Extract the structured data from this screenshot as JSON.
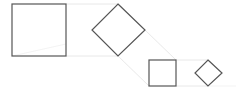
{
  "diagram": {
    "colors": {
      "shape_stroke": "#555555",
      "guide_stroke": "#e2e2e2",
      "background": "#ffffff"
    },
    "shapes": [
      {
        "id": "large-square",
        "type": "square",
        "x": 12,
        "y": 4,
        "size": 54
      },
      {
        "id": "large-diamond",
        "type": "diamond",
        "points": [
          [
            118,
            4
          ],
          [
            145,
            30
          ],
          [
            118,
            56
          ],
          [
            92,
            30
          ]
        ]
      },
      {
        "id": "small-square",
        "type": "square",
        "x": 149,
        "y": 60,
        "size": 27
      },
      {
        "id": "small-diamond",
        "type": "diamond",
        "points": [
          [
            208,
            60
          ],
          [
            222,
            73
          ],
          [
            208,
            86
          ],
          [
            195,
            73
          ]
        ]
      }
    ]
  }
}
